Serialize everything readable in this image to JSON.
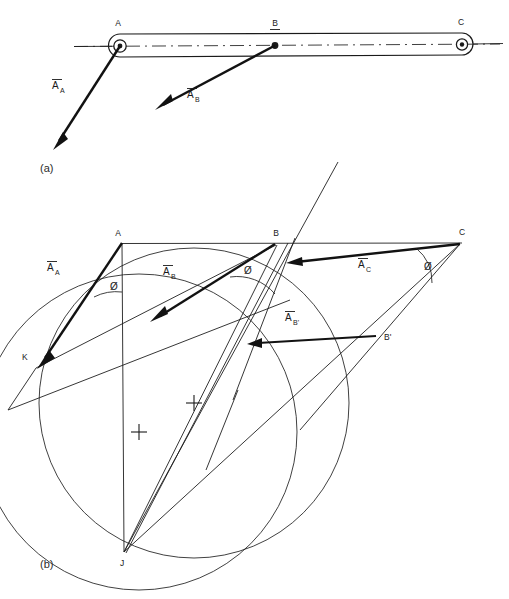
{
  "figure": {
    "title_a": "(a)",
    "title_b": "(b)",
    "part_a": {
      "points": [
        {
          "name": "A",
          "label": "A",
          "x": 120,
          "y": 46
        },
        {
          "name": "B",
          "label": "B",
          "x": 275,
          "y": 46
        },
        {
          "name": "C",
          "label": "C",
          "x": 462,
          "y": 45
        }
      ],
      "vectors": [
        {
          "name": "A_A",
          "base": "A",
          "label_main": "A",
          "label_overbar": true,
          "label_sub": "A",
          "label_x": 57,
          "label_y": 85,
          "tip_x": 55,
          "tip_y": 140
        },
        {
          "name": "A_B",
          "base": "B",
          "label_main": "A",
          "label_overbar": true,
          "label_sub": "B",
          "label_x": 192,
          "label_y": 97,
          "tip_x": 155,
          "tip_y": 109
        }
      ]
    },
    "part_b": {
      "points": [
        {
          "name": "A",
          "label": "A",
          "x": 122,
          "y": 243
        },
        {
          "name": "B",
          "label": "B",
          "x": 275,
          "y": 244
        },
        {
          "name": "C",
          "label": "C",
          "x": 460,
          "y": 243
        },
        {
          "name": "Bprime",
          "label": "B'",
          "x": 378,
          "y": 337
        },
        {
          "name": "K",
          "label": "K",
          "x": 36,
          "y": 368
        },
        {
          "name": "J",
          "label": "J",
          "x": 124,
          "y": 552
        }
      ],
      "vectors": [
        {
          "name": "A_A",
          "label_main": "A",
          "label_sub": "A",
          "label_x": 52,
          "label_y": 267
        },
        {
          "name": "A_B",
          "label_main": "A",
          "label_sub": "B",
          "label_x": 168,
          "label_y": 271
        },
        {
          "name": "A_C",
          "label_main": "A",
          "label_sub": "C",
          "label_x": 363,
          "label_y": 264
        },
        {
          "name": "A_Bprime",
          "label_main": "A",
          "label_sub": "B'",
          "label_x": 290,
          "label_y": 317
        }
      ],
      "angle_marks": [
        {
          "name": "phi-at-A",
          "symbol": "Ø",
          "x": 113,
          "y": 288
        },
        {
          "name": "phi-at-B",
          "symbol": "Ø",
          "x": 247,
          "y": 272
        },
        {
          "name": "phi-at-C",
          "symbol": "Ø",
          "x": 427,
          "y": 268
        }
      ],
      "circle_centers": [
        {
          "name": "center-left-circle",
          "x": 139,
          "y": 432
        },
        {
          "name": "center-right-circle",
          "x": 194,
          "y": 403
        }
      ],
      "circles": [
        {
          "name": "circle-AKJ",
          "cx": 139,
          "cy": 432,
          "r": 158
        },
        {
          "name": "circle-BJB2",
          "cx": 194,
          "cy": 403,
          "r": 155
        }
      ]
    }
  },
  "colors": {
    "ink": "#1a1a1a",
    "paper": "#ffffff"
  }
}
